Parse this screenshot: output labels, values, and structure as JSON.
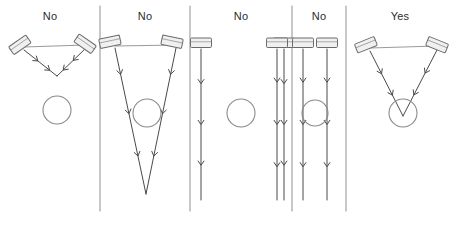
{
  "diagram": {
    "width": 454,
    "height": 226,
    "background_color": "#ffffff",
    "stroke_color": "#4a4a4a",
    "line_color": "#9a9a9a",
    "fixture_fill": "#f0f0f0",
    "fixture_stroke": "#6b6b6b",
    "target_stroke": "#8a8a8a",
    "label_color": "#2b2b2b",
    "dividers": [
      {
        "name": "divider-1",
        "x": 100,
        "y1": 6,
        "y2": 211
      },
      {
        "name": "divider-2",
        "x": 190,
        "y1": 6,
        "y2": 211
      },
      {
        "name": "divider-3",
        "x": 292,
        "y1": 6,
        "y2": 211
      },
      {
        "name": "divider-4",
        "x": 346,
        "y1": 6,
        "y2": 211
      }
    ],
    "panels": [
      {
        "id": "panel-1",
        "verdict": "No",
        "label_x": 50,
        "label_y": 10,
        "description": "Two angled fixtures cross above the target; beams converge short of the circle",
        "fixtures": [
          {
            "name": "fixture-left",
            "x": 20,
            "y": 45,
            "rotation": -35
          },
          {
            "name": "fixture-right",
            "x": 85,
            "y": 44,
            "rotation": 35
          }
        ],
        "mounting_bar": {
          "x1": 24,
          "y1": 47,
          "x2": 85,
          "y2": 45
        },
        "beams": [
          {
            "name": "beam-left",
            "x1": 24,
            "y1": 50,
            "x2": 57,
            "y2": 76,
            "arrows": [
              0.42,
              0.78
            ]
          },
          {
            "name": "beam-right",
            "x1": 85,
            "y1": 49,
            "x2": 57,
            "y2": 76,
            "arrows": [
              0.42,
              0.78
            ]
          }
        ],
        "target": {
          "name": "target-circle",
          "cx": 57,
          "cy": 110,
          "r": 14,
          "lit": false
        }
      },
      {
        "id": "panel-2",
        "verdict": "No",
        "label_x": 145,
        "label_y": 10,
        "description": "Two angled fixtures converge far below the target circle",
        "fixtures": [
          {
            "name": "fixture-left",
            "x": 110,
            "y": 42,
            "rotation": -12
          },
          {
            "name": "fixture-right",
            "x": 172,
            "y": 42,
            "rotation": 12
          }
        ],
        "mounting_bar": {
          "x1": 115,
          "y1": 46,
          "x2": 176,
          "y2": 45
        },
        "beams": [
          {
            "name": "beam-left",
            "x1": 115,
            "y1": 48,
            "x2": 146,
            "y2": 194,
            "arrows": [
              0.18,
              0.45,
              0.74
            ]
          },
          {
            "name": "beam-right",
            "x1": 176,
            "y1": 48,
            "x2": 146,
            "y2": 194,
            "arrows": [
              0.18,
              0.45,
              0.74
            ]
          }
        ],
        "target": {
          "name": "target-circle",
          "cx": 147,
          "cy": 113,
          "r": 14,
          "lit": false
        }
      },
      {
        "id": "panel-3",
        "verdict": "No",
        "label_x": 241,
        "label_y": 10,
        "description": "Two downward fixtures spread wide; beams miss the circle on both sides",
        "fixtures": [
          {
            "name": "fixture-left",
            "x": 201,
            "y": 43,
            "rotation": 0
          },
          {
            "name": "fixture-right",
            "x": 284,
            "y": 43,
            "rotation": 0
          }
        ],
        "mounting_bar": null,
        "beams": [
          {
            "name": "beam-left",
            "x1": 201,
            "y1": 49,
            "x2": 201,
            "y2": 200,
            "arrows": [
              0.23,
              0.5,
              0.77
            ]
          },
          {
            "name": "beam-right",
            "x1": 284,
            "y1": 49,
            "x2": 284,
            "y2": 200,
            "arrows": [
              0.23,
              0.5,
              0.77
            ]
          }
        ],
        "target": {
          "name": "target-circle",
          "cx": 241,
          "cy": 113,
          "r": 14,
          "lit": false
        }
      },
      {
        "id": "panel-4",
        "verdict": "No",
        "label_x": 319,
        "label_y": 10,
        "description": "Three downward fixtures; beams graze the circle tangentially without striking it",
        "fixtures": [
          {
            "name": "fixture-left",
            "x": 303,
            "y": 43,
            "rotation": 0
          },
          {
            "name": "fixture-center",
            "x": 327,
            "y": 43,
            "rotation": 0
          },
          {
            "name": "fixture-right",
            "x": 277,
            "y": 43,
            "rotation": 0
          }
        ],
        "mounting_bar": null,
        "beams": [
          {
            "name": "beam-left",
            "x1": 303,
            "y1": 49,
            "x2": 303,
            "y2": 200,
            "arrows": [
              0.22,
              0.5,
              0.78
            ]
          },
          {
            "name": "beam-center",
            "x1": 327,
            "y1": 49,
            "x2": 327,
            "y2": 200,
            "arrows": [
              0.22,
              0.5,
              0.78
            ]
          },
          {
            "name": "beam-outer",
            "x1": 277,
            "y1": 49,
            "x2": 277,
            "y2": 200,
            "arrows": [
              0.22,
              0.5,
              0.78
            ]
          }
        ],
        "target": {
          "name": "target-circle",
          "cx": 315,
          "cy": 113,
          "r": 13,
          "lit": false
        }
      },
      {
        "id": "panel-5",
        "verdict": "Yes",
        "label_x": 400,
        "label_y": 10,
        "description": "Two angled fixtures converge precisely on the target circle",
        "fixtures": [
          {
            "name": "fixture-left",
            "x": 366,
            "y": 45,
            "rotation": -22
          },
          {
            "name": "fixture-right",
            "x": 437,
            "y": 45,
            "rotation": 22
          }
        ],
        "mounting_bar": {
          "x1": 370,
          "y1": 48,
          "x2": 437,
          "y2": 46
        },
        "beams": [
          {
            "name": "beam-left",
            "x1": 370,
            "y1": 51,
            "x2": 403,
            "y2": 116,
            "arrows": [
              0.35,
              0.68
            ]
          },
          {
            "name": "beam-right",
            "x1": 437,
            "y1": 50,
            "x2": 403,
            "y2": 116,
            "arrows": [
              0.35,
              0.68
            ]
          }
        ],
        "target": {
          "name": "target-circle",
          "cx": 403,
          "cy": 113,
          "r": 14,
          "lit": true
        }
      }
    ]
  }
}
